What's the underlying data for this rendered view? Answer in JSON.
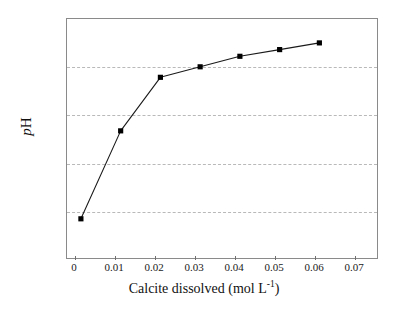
{
  "chart_data": {
    "type": "line",
    "title": "",
    "subtitle": "",
    "xlabel": "Calcite dissolved (mol L",
    "xlabel_exponent": "-1",
    "xlabel_close": ")",
    "ylabel_italic": "p",
    "ylabel_roman": "H",
    "ylabel": "pH",
    "x": [
      0,
      0.01,
      0.02,
      0.03,
      0.04,
      0.05,
      0.06
    ],
    "values": [
      1.82,
      3.66,
      4.78,
      5.0,
      5.22,
      5.36,
      5.5
    ],
    "series": [
      {
        "name": "pH vs calcite dissolved",
        "x": [
          0,
          0.01,
          0.02,
          0.03,
          0.04,
          0.05,
          0.06
        ],
        "values": [
          1.82,
          3.66,
          4.78,
          5.0,
          5.22,
          5.36,
          5.5
        ]
      }
    ],
    "xlim": [
      -0.0035,
      0.0745
    ],
    "ylim": [
      1,
      6
    ],
    "xticks": [
      0,
      0.01,
      0.02,
      0.03,
      0.04,
      0.05,
      0.06,
      0.07
    ],
    "xticklabels": [
      "0",
      "0.01",
      "0.02",
      "0.03",
      "0.04",
      "0.05",
      "0.06",
      "0.07"
    ],
    "yticks": [
      1,
      2,
      3,
      4,
      5,
      6
    ],
    "yticklabels": [
      "1",
      "2",
      "3",
      "4",
      "5",
      "6"
    ],
    "gridlines_y": [
      2,
      3,
      4,
      5
    ],
    "grid": "horizontal-dashed",
    "legend": "none",
    "marker": "filled-square",
    "marker_color": "#000000",
    "line_color": "#1a1a1a",
    "grid_color": "#b9b9b9",
    "frame_color": "#8a8a8a",
    "background": "#ffffff"
  }
}
